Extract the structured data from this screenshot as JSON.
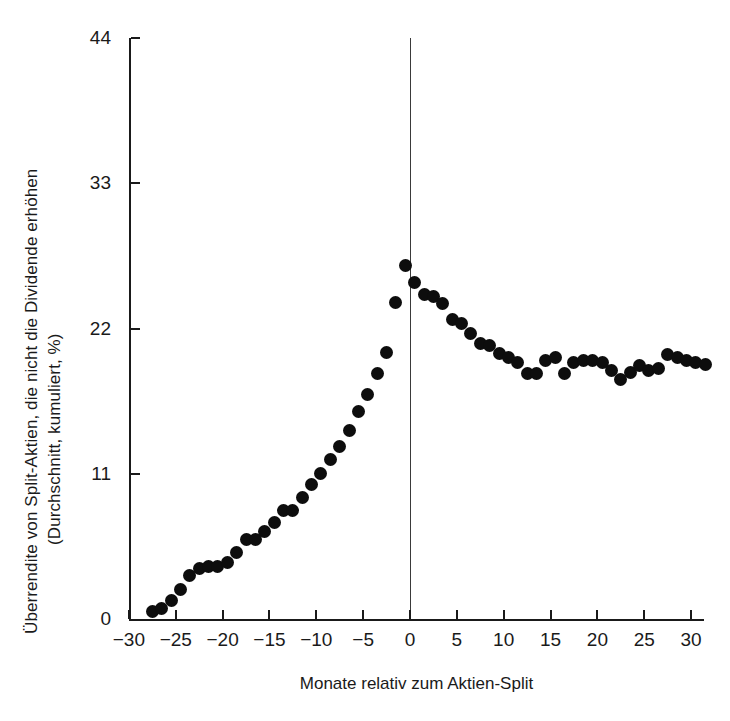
{
  "chart_data": {
    "type": "scatter",
    "title": "",
    "xlabel": "Monate relativ zum Aktien-Split",
    "ylabel": "Überrendite von Split-Aktien, die nicht die Dividende erhöhen (Durchschnitt, kumuliert, %)",
    "ylabel_line1": "Überrendite von Split-Aktien, die nicht die Dividende erhöhen",
    "ylabel_line2": "(Durchschnitt, kumuliert, %)",
    "xlim": [
      -30,
      31.5
    ],
    "ylim": [
      0,
      44
    ],
    "xticks": [
      -30,
      -25,
      -20,
      -15,
      -10,
      -5,
      0,
      5,
      10,
      15,
      20,
      25,
      30
    ],
    "xtick_labels": [
      "−30",
      "−25",
      "−20",
      "−15",
      "−10",
      "−5",
      "0",
      "5",
      "10",
      "15",
      "20",
      "25",
      "30"
    ],
    "yticks": [
      0,
      11,
      22,
      33,
      44
    ],
    "ytick_labels": [
      "0",
      "11",
      "22",
      "33",
      "44"
    ],
    "grid": false,
    "legend": false,
    "marker": "filled-circle",
    "marker_color": "#0d0d0d",
    "reference_line_x": 0,
    "x": [
      -27.5,
      -26.5,
      -25.5,
      -24.5,
      -23.5,
      -22.5,
      -21.5,
      -20.5,
      -19.5,
      -18.5,
      -17.5,
      -16.5,
      -15.5,
      -14.5,
      -13.5,
      -12.5,
      -11.5,
      -10.5,
      -9.5,
      -8.5,
      -7.5,
      -6.5,
      -5.5,
      -4.5,
      -3.5,
      -2.5,
      -1.5,
      -0.5,
      0.5,
      1.5,
      2.5,
      3.5,
      4.5,
      5.5,
      6.5,
      7.5,
      8.5,
      9.5,
      10.5,
      11.5,
      12.5,
      13.5,
      14.5,
      15.5,
      16.5,
      17.5,
      18.5,
      19.5,
      20.5,
      21.5,
      22.5,
      23.5,
      24.5,
      25.5,
      26.5,
      27.5,
      28.5,
      29.5,
      30.5,
      31.5
    ],
    "y": [
      0.6,
      0.8,
      1.4,
      2.2,
      3.3,
      3.8,
      4.0,
      4.0,
      4.3,
      5.0,
      6.0,
      6.0,
      6.6,
      7.3,
      8.2,
      8.2,
      9.2,
      10.2,
      11.0,
      12.1,
      13.1,
      14.3,
      15.7,
      17.0,
      18.6,
      20.2,
      24.0,
      26.8,
      25.5,
      24.6,
      24.4,
      23.9,
      22.7,
      22.4,
      21.6,
      20.9,
      20.7,
      20.1,
      19.8,
      19.4,
      18.6,
      18.6,
      19.6,
      19.8,
      18.6,
      19.4,
      19.6,
      19.6,
      19.4,
      18.8,
      18.1,
      18.7,
      19.2,
      18.8,
      19.0,
      20.0,
      19.8,
      19.6,
      19.4,
      19.3
    ]
  },
  "axes": {
    "y_ticks": [
      {
        "label": "44",
        "value": 44
      },
      {
        "label": "33",
        "value": 33
      },
      {
        "label": "22",
        "value": 22
      },
      {
        "label": "11",
        "value": 11
      },
      {
        "label": "0",
        "value": 0
      }
    ],
    "x_ticks": [
      {
        "label": "−30",
        "value": -30
      },
      {
        "label": "−25",
        "value": -25
      },
      {
        "label": "−20",
        "value": -20
      },
      {
        "label": "−15",
        "value": -15
      },
      {
        "label": "−10",
        "value": -10
      },
      {
        "label": "−5",
        "value": -5
      },
      {
        "label": "0",
        "value": 0
      },
      {
        "label": "5",
        "value": 5
      },
      {
        "label": "10",
        "value": 10
      },
      {
        "label": "15",
        "value": 15
      },
      {
        "label": "20",
        "value": 20
      },
      {
        "label": "25",
        "value": 25
      },
      {
        "label": "30",
        "value": 30
      }
    ]
  }
}
